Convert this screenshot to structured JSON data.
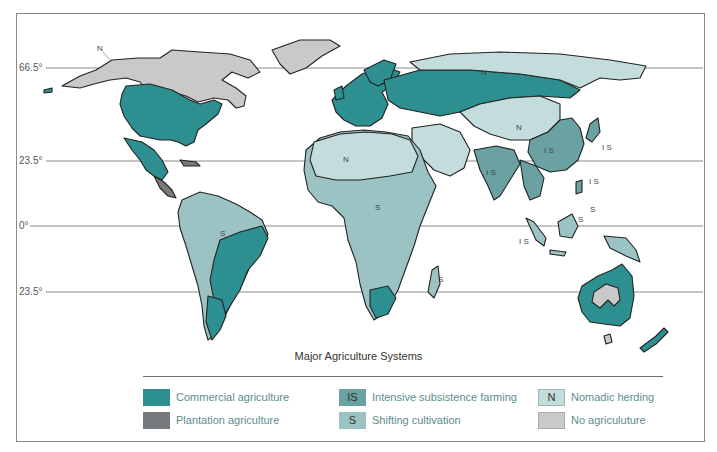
{
  "map": {
    "title": "Major Agriculture Systems",
    "latitude_lines": [
      {
        "label": "66.5°",
        "y": 68
      },
      {
        "label": "23.5°",
        "y": 161
      },
      {
        "label": "0°",
        "y": 226
      },
      {
        "label": "23.5°",
        "y": 292
      }
    ],
    "map_labels": [
      {
        "code": "N",
        "region": "Alaska",
        "x": 100,
        "y": 49
      },
      {
        "code": "N",
        "region": "Northern Russia",
        "x": 484,
        "y": 73
      },
      {
        "code": "N",
        "region": "Mongolia / Central Asia",
        "x": 519,
        "y": 128
      },
      {
        "code": "IS",
        "region": "China",
        "x": 547,
        "y": 151
      },
      {
        "code": "IS",
        "region": "Japan",
        "x": 604,
        "y": 148
      },
      {
        "code": "IS",
        "region": "India",
        "x": 490,
        "y": 173
      },
      {
        "code": "IS",
        "region": "Philippines",
        "x": 591,
        "y": 182
      },
      {
        "code": "S",
        "region": "Philippines south",
        "x": 592,
        "y": 210
      },
      {
        "code": "S",
        "region": "Borneo",
        "x": 580,
        "y": 220
      },
      {
        "code": "IS",
        "region": "Sumatra",
        "x": 524,
        "y": 242
      },
      {
        "code": "N",
        "region": "Sahara",
        "x": 346,
        "y": 160
      },
      {
        "code": "S",
        "region": "Central Africa",
        "x": 378,
        "y": 208
      },
      {
        "code": "S",
        "region": "Madagascar",
        "x": 440,
        "y": 280
      },
      {
        "code": "S",
        "region": "Amazon",
        "x": 223,
        "y": 234
      }
    ]
  },
  "legend": {
    "title": "Major Agriculture Systems",
    "items": [
      {
        "code": "",
        "label": "Commercial agriculture",
        "color": "#2e8f90"
      },
      {
        "code": "",
        "label": "Plantation agriculture",
        "color": "#777a7d"
      },
      {
        "code": "IS",
        "label": "Intensive subsistence farming",
        "color": "#6aa1a3"
      },
      {
        "code": "S",
        "label": "Shifting cultivation",
        "color": "#9cc3c4"
      },
      {
        "code": "N",
        "label": "Nomadic herding",
        "color": "#c3dcdc"
      },
      {
        "code": "",
        "label": "No agriculuture",
        "color": "#c9c9ca"
      }
    ]
  },
  "colors": {
    "commercial": "#2e8f90",
    "plantation": "#777a7d",
    "intensive_subsistence": "#6aa1a3",
    "shifting": "#9cc3c4",
    "nomadic": "#c3dcdc",
    "none": "#c9c9ca",
    "border": "#222222",
    "latitude_line": "#8a8a8a"
  }
}
